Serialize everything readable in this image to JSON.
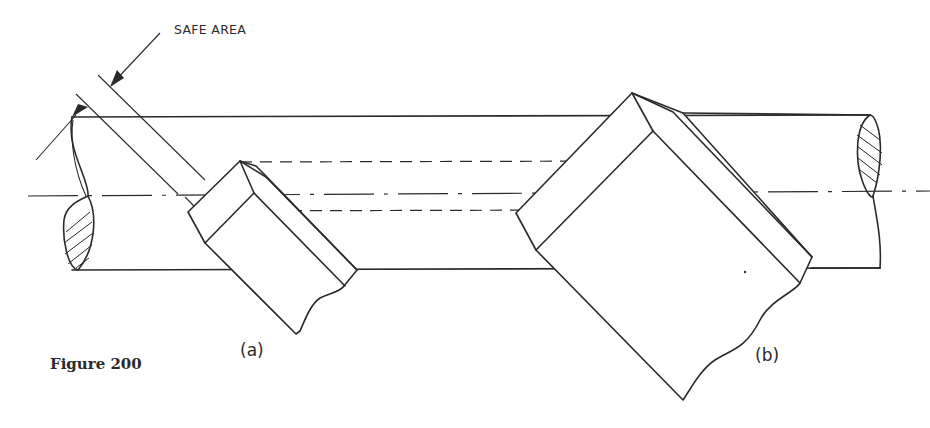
{
  "figure": {
    "caption": "Figure 200",
    "callout_label": "SAFE AREA",
    "views": [
      {
        "id": "a",
        "label": "(a)"
      },
      {
        "id": "b",
        "label": "(b)"
      }
    ]
  },
  "colors": {
    "ink": "#2a2a2a",
    "paper": "#ffffff"
  }
}
